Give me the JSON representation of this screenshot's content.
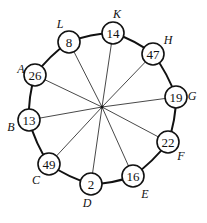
{
  "diagram": {
    "hub": {
      "x": 102,
      "y": 107
    },
    "node_radius": 11,
    "nodes": [
      {
        "label": "L",
        "value": "8",
        "x": 69,
        "y": 42,
        "lx": 60,
        "ly": 24
      },
      {
        "label": "K",
        "value": "14",
        "x": 113,
        "y": 33,
        "lx": 117,
        "ly": 14
      },
      {
        "label": "H",
        "value": "47",
        "x": 153,
        "y": 54,
        "lx": 168,
        "ly": 40
      },
      {
        "label": "G",
        "value": "19",
        "x": 176,
        "y": 97,
        "lx": 192,
        "ly": 96
      },
      {
        "label": "F",
        "value": "22",
        "x": 168,
        "y": 142,
        "lx": 181,
        "ly": 156
      },
      {
        "label": "E",
        "value": "16",
        "x": 133,
        "y": 176,
        "lx": 145,
        "ly": 194
      },
      {
        "label": "D",
        "value": "2",
        "x": 91,
        "y": 184,
        "lx": 87,
        "ly": 203
      },
      {
        "label": "C",
        "value": "49",
        "x": 49,
        "y": 164,
        "lx": 36,
        "ly": 180
      },
      {
        "label": "B",
        "value": "13",
        "x": 29,
        "y": 120,
        "lx": 11,
        "ly": 127
      },
      {
        "label": "A",
        "value": "26",
        "x": 35,
        "y": 75,
        "lx": 21,
        "ly": 69
      }
    ]
  }
}
